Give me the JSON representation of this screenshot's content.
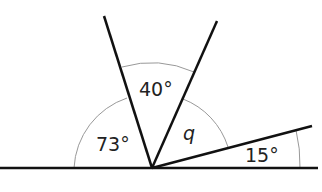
{
  "diagram": {
    "type": "angles on a straight line",
    "labels": {
      "a73": "73°",
      "a40": "40°",
      "q": "q",
      "a15": "15°"
    },
    "colors": {
      "line": "#111111",
      "arc": "#999999"
    }
  }
}
